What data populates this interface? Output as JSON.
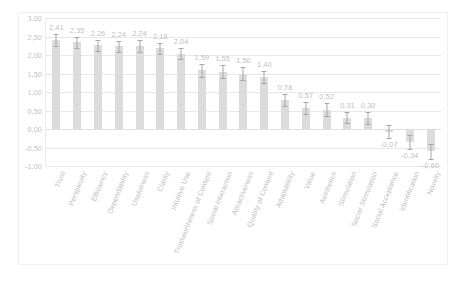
{
  "chart_data": {
    "type": "bar",
    "title": "",
    "xlabel": "",
    "ylabel": "",
    "ylim": [
      -1.0,
      3.0
    ],
    "ytick_labels": [
      "3,00",
      "2,50",
      "2,00",
      "1,50",
      "1,00",
      "0,50",
      "0,00",
      "-0,50",
      "-1,00"
    ],
    "ytick_values": [
      3.0,
      2.5,
      2.0,
      1.5,
      1.0,
      0.5,
      0.0,
      -0.5,
      -1.0
    ],
    "grid": true,
    "legend": "none",
    "decimal_separator": ",",
    "error_bars": true,
    "categories": [
      "Trust",
      "Perspicuity",
      "Efficiency",
      "Dependability",
      "Usefulness",
      "Clarity",
      "Intuitive Use",
      "Trustworthiness of Content",
      "Social Interaction",
      "Attractiveness",
      "Quality of Content",
      "Adaptability",
      "Value",
      "Aesthetics",
      "Stimulation",
      "Social Stimulation",
      "Social Acceptance",
      "Identification",
      "Novelty"
    ],
    "values": [
      2.41,
      2.35,
      2.26,
      2.24,
      2.24,
      2.18,
      2.04,
      1.59,
      1.55,
      1.5,
      1.4,
      0.78,
      0.57,
      0.52,
      0.31,
      0.3,
      -0.07,
      -0.34,
      -0.6
    ],
    "value_labels": [
      "2,41",
      "2,35",
      "2,26",
      "2,24",
      "2,24",
      "2,18",
      "2,04",
      "1,59",
      "1,55",
      "1,50",
      "1,40",
      "0,78",
      "0,57",
      "0,52",
      "0,31",
      "0,30",
      "-0,07",
      "-0,34",
      "-0,60"
    ],
    "errors": [
      0.16,
      0.15,
      0.14,
      0.15,
      0.16,
      0.14,
      0.16,
      0.18,
      0.18,
      0.17,
      0.17,
      0.17,
      0.17,
      0.17,
      0.16,
      0.16,
      0.18,
      0.19,
      0.2
    ],
    "bar_color": "#dcdcdc",
    "error_color": "#a8a8a8",
    "gridline_color": "#e8e8e8",
    "label_color": "#c0c0c0"
  }
}
